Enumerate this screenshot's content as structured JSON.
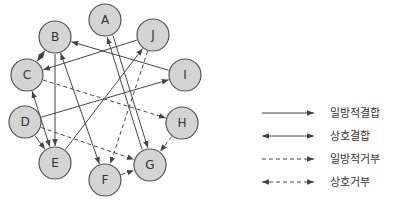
{
  "nodes": [
    {
      "id": "A",
      "label": "A",
      "cx": 105,
      "cy": 20
    },
    {
      "id": "J",
      "label": "J",
      "cx": 153,
      "cy": 35
    },
    {
      "id": "B",
      "label": "B",
      "cx": 55,
      "cy": 37
    },
    {
      "id": "C",
      "label": "C",
      "cx": 27,
      "cy": 75
    },
    {
      "id": "I",
      "label": "I",
      "cx": 185,
      "cy": 75
    },
    {
      "id": "D",
      "label": "D",
      "cx": 25,
      "cy": 122
    },
    {
      "id": "H",
      "label": "H",
      "cx": 182,
      "cy": 123
    },
    {
      "id": "E",
      "label": "E",
      "cx": 55,
      "cy": 163
    },
    {
      "id": "G",
      "label": "G",
      "cx": 150,
      "cy": 165
    },
    {
      "id": "F",
      "label": "F",
      "cx": 105,
      "cy": 180
    }
  ],
  "edges": [
    {
      "from": "B",
      "to": "C",
      "type": "mutual-bond"
    },
    {
      "from": "J",
      "to": "C",
      "type": "one-way-bond"
    },
    {
      "from": "I",
      "to": "B",
      "type": "one-way-bond"
    },
    {
      "from": "B",
      "to": "E",
      "type": "one-way-bond"
    },
    {
      "from": "B",
      "to": "F",
      "type": "mutual-bond"
    },
    {
      "from": "C",
      "to": "E",
      "type": "mutual-bond"
    },
    {
      "from": "D",
      "to": "I",
      "type": "one-way-bond"
    },
    {
      "from": "D",
      "to": "E",
      "type": "one-way-bond"
    },
    {
      "from": "E",
      "to": "J",
      "type": "one-way-bond"
    },
    {
      "from": "A",
      "to": "G",
      "type": "one-way-bond"
    },
    {
      "from": "G",
      "to": "A",
      "type": "one-way-bond"
    },
    {
      "from": "C",
      "to": "H",
      "type": "one-way-reject"
    },
    {
      "from": "D",
      "to": "G",
      "type": "one-way-reject"
    },
    {
      "from": "J",
      "to": "F",
      "type": "one-way-reject"
    },
    {
      "from": "H",
      "to": "G",
      "type": "one-way-reject"
    },
    {
      "from": "F",
      "to": "G",
      "type": "one-way-reject"
    }
  ],
  "legend": {
    "items": [
      {
        "style": "solid",
        "ends": "one",
        "label": "일방적결합"
      },
      {
        "style": "solid",
        "ends": "both",
        "label": "상호결합"
      },
      {
        "style": "dashed",
        "ends": "one",
        "label": "일방적거부"
      },
      {
        "style": "dashed",
        "ends": "both",
        "label": "상호거부"
      }
    ]
  }
}
